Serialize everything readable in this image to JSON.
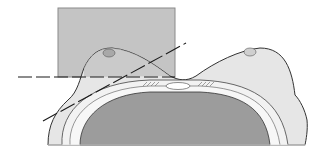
{
  "diagram": {
    "colors": {
      "background": "#ffffff",
      "field_box": "#c4c4c4",
      "field_box_border": "#8a8a8a",
      "skin": "#e6e6e6",
      "breast_shadow": "#bdbdbd",
      "chest_wall_ring": "#f2f2f2",
      "lung": "#9c9c9c",
      "outline": "#333333",
      "line": "#1a1a1a"
    },
    "elements": {
      "field_rectangle": {
        "x": 58,
        "y": 8,
        "w": 117,
        "h": 69
      },
      "horizontal_dashed_line": {
        "x1": 18,
        "y1": 77,
        "x2": 175,
        "y2": 77
      },
      "oblique_dashed_line": {
        "x1": 43,
        "y1": 121,
        "x2": 186,
        "y2": 43
      }
    }
  }
}
